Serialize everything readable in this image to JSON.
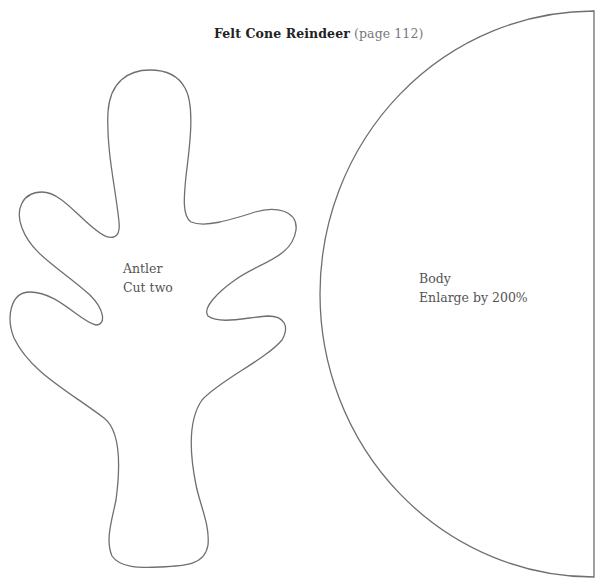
{
  "title": {
    "name": "Felt Cone Reindeer",
    "page_ref": "(page 112)"
  },
  "pieces": [
    {
      "id": "antler",
      "name": "Antler",
      "instruction": "Cut two"
    },
    {
      "id": "body",
      "name": "Body",
      "instruction": "Enlarge by 200%"
    }
  ],
  "colors": {
    "outline": "#6f6f6f",
    "text": "#555555",
    "background": "#ffffff"
  }
}
